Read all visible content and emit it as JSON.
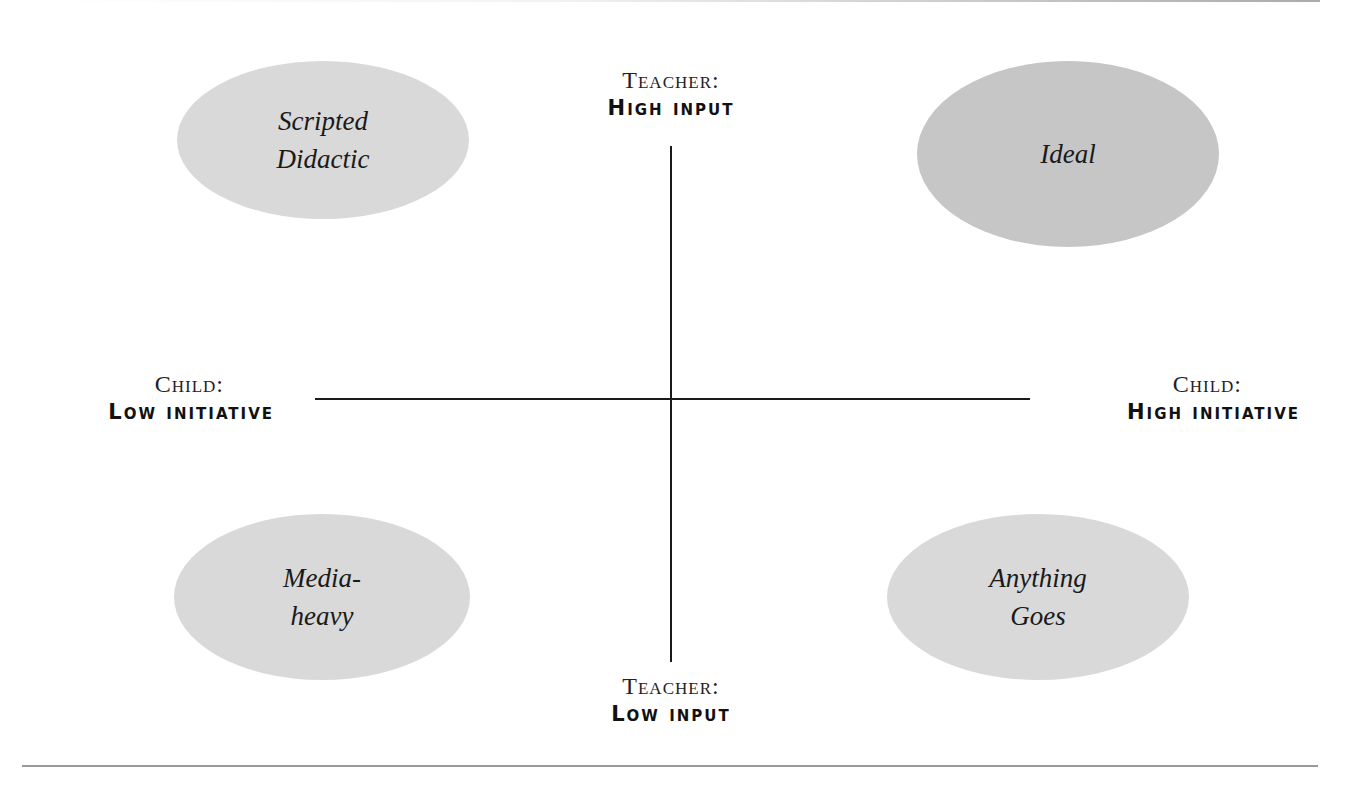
{
  "diagram": {
    "type": "quadrant",
    "axes": {
      "top": {
        "role": "Teacher:",
        "level": "High input"
      },
      "bottom": {
        "role": "Teacher:",
        "level": "Low input"
      },
      "left": {
        "role": "Child:",
        "level": "Low initiative"
      },
      "right": {
        "role": "Child:",
        "level": "High initiative"
      }
    },
    "quadrants": {
      "top_left": {
        "line1": "Scripted",
        "line2": "Didactic",
        "fill": "#d9d9d9"
      },
      "top_right": {
        "line1": "Ideal",
        "line2": "",
        "fill": "#c6c6c6"
      },
      "bottom_left": {
        "line1": "Media-",
        "line2": "heavy",
        "fill": "#d9d9d9"
      },
      "bottom_right": {
        "line1": "Anything",
        "line2": "Goes",
        "fill": "#d9d9d9"
      }
    },
    "colors": {
      "axis": "#1a1a1a",
      "rule": "#9a9a9a",
      "background": "#ffffff"
    }
  }
}
